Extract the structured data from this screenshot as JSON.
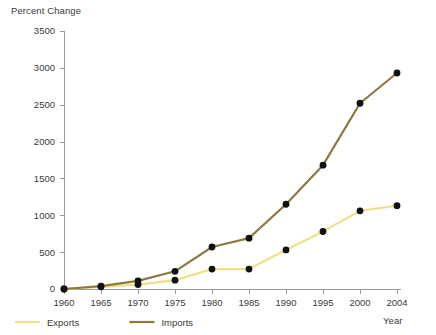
{
  "chart_data": {
    "type": "line",
    "title": "",
    "ylabel": "Percent Change",
    "xlabel": "Year",
    "categories": [
      1960,
      1965,
      1970,
      1975,
      1980,
      1985,
      1990,
      1995,
      2000,
      2004
    ],
    "xtick_labels": [
      "1960",
      "1965",
      "1970",
      "1975",
      "1980",
      "1985",
      "1990",
      "1995",
      "2000",
      "2004"
    ],
    "ytick_labels": [
      "0",
      "500",
      "1000",
      "1500",
      "2000",
      "2500",
      "3000",
      "3500"
    ],
    "ytick_values": [
      0,
      500,
      1000,
      1500,
      2000,
      2500,
      3000,
      3500
    ],
    "ylim": [
      0,
      3500
    ],
    "xlim": [
      1960,
      2004
    ],
    "grid": false,
    "legend_position": "bottom-left",
    "series": [
      {
        "name": "Exports",
        "color": "#EFE08A",
        "values": [
          0,
          30,
          60,
          120,
          270,
          270,
          530,
          780,
          1060,
          1130
        ]
      },
      {
        "name": "Imports",
        "color": "#8C7A3F",
        "values": [
          0,
          40,
          110,
          240,
          570,
          690,
          1150,
          1680,
          2520,
          2930
        ]
      }
    ],
    "marker_color": "#111111",
    "axis_color": "#9A9A9A"
  },
  "legend": {
    "items": [
      {
        "label": "Exports",
        "color": "#EFE08A"
      },
      {
        "label": "Imports",
        "color": "#8C7A3F"
      }
    ]
  }
}
